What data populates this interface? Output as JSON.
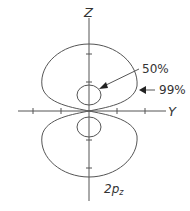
{
  "diagram": {
    "axes": {
      "vertical_label": "Z",
      "horizontal_label": "Y"
    },
    "contours": [
      {
        "label": "50%",
        "description": "inner contour enclosing 50% probability"
      },
      {
        "label": "99%",
        "description": "outer contour enclosing 99% probability"
      }
    ],
    "orbital": {
      "main": "2p",
      "subscript": "z"
    },
    "colors": {
      "line": "#555555",
      "text": "#333333",
      "background": "#ffffff"
    }
  }
}
